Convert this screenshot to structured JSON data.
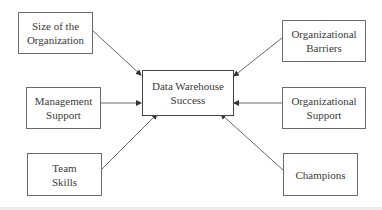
{
  "diagram": {
    "type": "influence-diagram",
    "center": {
      "id": "success",
      "lines": [
        "Data Warehouse",
        "Success"
      ]
    },
    "factors": [
      {
        "id": "size",
        "lines": [
          "Size of the",
          "Organization"
        ],
        "position": "top-left"
      },
      {
        "id": "management",
        "lines": [
          "Management",
          "Support"
        ],
        "position": "middle-left"
      },
      {
        "id": "team",
        "lines": [
          "Team",
          "Skills"
        ],
        "position": "bottom-left"
      },
      {
        "id": "barriers",
        "lines": [
          "Organizational",
          "Barriers"
        ],
        "position": "top-right"
      },
      {
        "id": "orgsupport",
        "lines": [
          "Organizational",
          "Support"
        ],
        "position": "middle-right"
      },
      {
        "id": "champions",
        "lines": [
          "Champions"
        ],
        "position": "bottom-right"
      }
    ],
    "edges": [
      {
        "from": "size",
        "to": "success"
      },
      {
        "from": "management",
        "to": "success"
      },
      {
        "from": "team",
        "to": "success"
      },
      {
        "from": "barriers",
        "to": "success"
      },
      {
        "from": "orgsupport",
        "to": "success"
      },
      {
        "from": "champions",
        "to": "success"
      }
    ],
    "colors": {
      "border": "#6a6a6a",
      "text": "#3a3a3a",
      "arrow": "#555555"
    }
  }
}
